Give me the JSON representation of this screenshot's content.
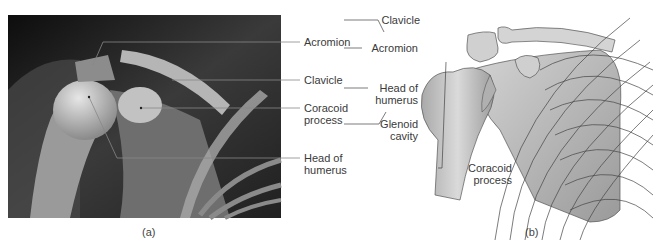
{
  "figure": {
    "panel_a": {
      "caption": "(a)",
      "type": "x-ray",
      "labels": [
        {
          "id": "acromion",
          "text": "Acromion"
        },
        {
          "id": "clavicle",
          "text": "Clavicle"
        },
        {
          "id": "coracoid",
          "line1": "Coracoid",
          "line2": "process"
        },
        {
          "id": "head-humerus",
          "line1": "Head of",
          "line2": "humerus"
        }
      ]
    },
    "panel_b": {
      "caption": "(b)",
      "type": "illustration",
      "labels": [
        {
          "id": "clavicle",
          "text": "Clavicle"
        },
        {
          "id": "acromion",
          "text": "Acromion"
        },
        {
          "id": "head-humerus",
          "line1": "Head of",
          "line2": "humerus"
        },
        {
          "id": "glenoid",
          "line1": "Glenoid",
          "line2": "cavity"
        },
        {
          "id": "coracoid",
          "line1": "Coracoid",
          "line2": "process"
        }
      ]
    },
    "colors": {
      "xray_dark": "#1a1a1a",
      "bone_light": "#d9d9d9",
      "leader_line": "#555555",
      "drawing_fill": "#c8c8c8"
    }
  }
}
